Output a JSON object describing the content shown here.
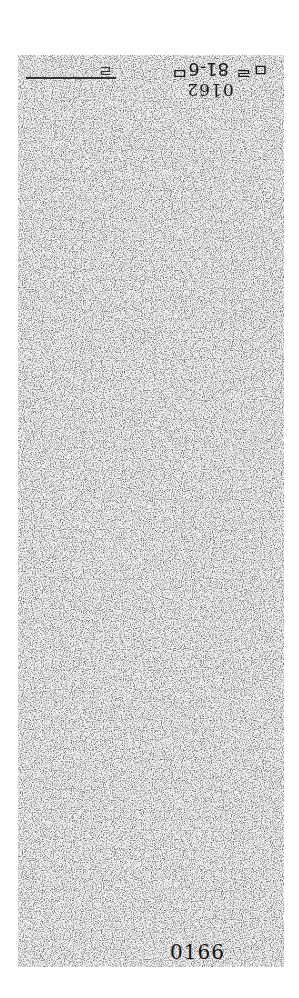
{
  "document": {
    "type": "scanned page (noisy, upside-down)",
    "header_handwriting": "ㅁᄅ 81-6ᄆ",
    "header_mark": "ㄹ",
    "top_number_inverted": "0162",
    "bottom_number": "0166"
  }
}
